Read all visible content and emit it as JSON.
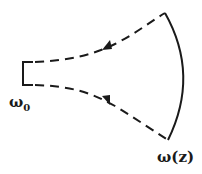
{
  "diagram": {
    "type": "beam-propagation",
    "labels": {
      "waist": "ω",
      "waist_sub": "0",
      "beam_width": "ω(z)"
    },
    "colors": {
      "stroke": "#1a1a1a",
      "background": "#ffffff"
    },
    "elements": [
      {
        "name": "waist-bracket",
        "style": "solid"
      },
      {
        "name": "upper-beam-edge",
        "style": "dashed",
        "arrow": "toward-right"
      },
      {
        "name": "lower-beam-edge",
        "style": "dashed",
        "arrow": "toward-right"
      },
      {
        "name": "wavefront-arc",
        "style": "solid"
      }
    ]
  }
}
